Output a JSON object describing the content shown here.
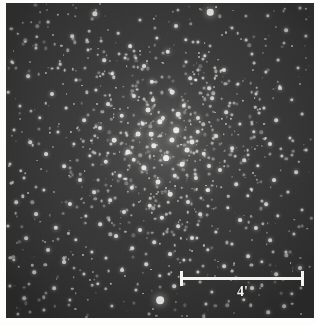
{
  "figure": {
    "kind": "astronomical-photographic-plate",
    "background_color": "#3a3a3a",
    "star_color": "#f2f2ee",
    "paper_color": "#fdfdfb",
    "plate": {
      "left": 6,
      "top": 3,
      "width": 308,
      "height": 315
    }
  },
  "scale_bar": {
    "label": "4'",
    "label_x": 237,
    "label_y": 285,
    "line_x1": 180,
    "line_x2": 304,
    "line_y": 277,
    "line_thickness": 3,
    "cap_height": 15,
    "color": "#f4f4f0"
  },
  "cluster": {
    "center_x": 166,
    "center_y": 142,
    "core_radius": 70
  },
  "chart_data": {
    "type": "scatter",
    "title": "",
    "xlabel": "",
    "ylabel": "",
    "xlim": [
      0,
      308
    ],
    "ylim": [
      0,
      315
    ],
    "grid": false,
    "legend": null,
    "annotations": [
      {
        "text": "4'",
        "x": 237,
        "y": 285
      }
    ],
    "series": [
      {
        "name": "stars",
        "points": [
          [
            95,
            14,
            3.4
          ],
          [
            210,
            12,
            4.2
          ],
          [
            268,
            16,
            2.2
          ],
          [
            300,
            8,
            2.0
          ],
          [
            48,
            22,
            1.8
          ],
          [
            140,
            20,
            2.0
          ],
          [
            176,
            26,
            2.6
          ],
          [
            232,
            28,
            1.9
          ],
          [
            286,
            30,
            2.4
          ],
          [
            18,
            34,
            1.6
          ],
          [
            72,
            36,
            2.3
          ],
          [
            118,
            33,
            1.7
          ],
          [
            157,
            38,
            2.1
          ],
          [
            198,
            42,
            2.0
          ],
          [
            246,
            40,
            1.8
          ],
          [
            306,
            36,
            2.1
          ],
          [
            36,
            48,
            2.0
          ],
          [
            88,
            50,
            1.9
          ],
          [
            130,
            46,
            2.4
          ],
          [
            168,
            52,
            2.9
          ],
          [
            205,
            56,
            2.2
          ],
          [
            252,
            54,
            2.0
          ],
          [
            278,
            60,
            1.8
          ],
          [
            12,
            62,
            2.2
          ],
          [
            60,
            64,
            1.7
          ],
          [
            104,
            60,
            2.3
          ],
          [
            144,
            66,
            2.5
          ],
          [
            186,
            62,
            1.9
          ],
          [
            224,
            70,
            2.6
          ],
          [
            266,
            72,
            2.1
          ],
          [
            298,
            68,
            1.9
          ],
          [
            28,
            76,
            2.4
          ],
          [
            76,
            80,
            1.8
          ],
          [
            112,
            74,
            2.2
          ],
          [
            152,
            82,
            2.8
          ],
          [
            190,
            78,
            2.3
          ],
          [
            238,
            84,
            2.0
          ],
          [
            280,
            88,
            2.5
          ],
          [
            8,
            92,
            1.7
          ],
          [
            52,
            94,
            2.6
          ],
          [
            96,
            90,
            2.0
          ],
          [
            134,
            96,
            2.7
          ],
          [
            172,
            92,
            3.0
          ],
          [
            212,
            98,
            2.4
          ],
          [
            256,
            94,
            1.9
          ],
          [
            292,
            100,
            2.2
          ],
          [
            20,
            106,
            2.0
          ],
          [
            66,
            108,
            1.8
          ],
          [
            108,
            104,
            2.5
          ],
          [
            148,
            110,
            3.2
          ],
          [
            184,
            106,
            2.8
          ],
          [
            226,
            112,
            2.3
          ],
          [
            264,
            108,
            2.0
          ],
          [
            302,
            114,
            1.8
          ],
          [
            40,
            118,
            2.2
          ],
          [
            84,
            120,
            2.4
          ],
          [
            122,
            116,
            2.9
          ],
          [
            160,
            122,
            3.4
          ],
          [
            198,
            118,
            2.6
          ],
          [
            240,
            124,
            2.1
          ],
          [
            276,
            120,
            2.3
          ],
          [
            14,
            130,
            1.9
          ],
          [
            58,
            132,
            2.0
          ],
          [
            100,
            128,
            2.7
          ],
          [
            138,
            134,
            3.1
          ],
          [
            176,
            130,
            3.6
          ],
          [
            216,
            136,
            2.5
          ],
          [
            254,
            132,
            2.2
          ],
          [
            290,
            138,
            2.0
          ],
          [
            30,
            142,
            2.3
          ],
          [
            74,
            144,
            2.1
          ],
          [
            114,
            140,
            3.0
          ],
          [
            154,
            146,
            3.5
          ],
          [
            192,
            142,
            3.2
          ],
          [
            232,
            148,
            2.4
          ],
          [
            270,
            144,
            2.6
          ],
          [
            306,
            150,
            1.8
          ],
          [
            46,
            154,
            2.5
          ],
          [
            90,
            156,
            2.2
          ],
          [
            128,
            152,
            3.3
          ],
          [
            166,
            158,
            3.8
          ],
          [
            204,
            154,
            2.9
          ],
          [
            244,
            160,
            2.3
          ],
          [
            282,
            156,
            2.1
          ],
          [
            10,
            164,
            2.0
          ],
          [
            64,
            166,
            2.4
          ],
          [
            106,
            162,
            2.8
          ],
          [
            144,
            168,
            3.4
          ],
          [
            182,
            164,
            3.0
          ],
          [
            220,
            170,
            2.6
          ],
          [
            258,
            166,
            2.2
          ],
          [
            296,
            172,
            2.4
          ],
          [
            24,
            178,
            1.9
          ],
          [
            80,
            180,
            2.6
          ],
          [
            120,
            176,
            2.9
          ],
          [
            158,
            182,
            3.2
          ],
          [
            196,
            178,
            2.7
          ],
          [
            236,
            184,
            2.3
          ],
          [
            274,
            180,
            2.5
          ],
          [
            44,
            190,
            2.1
          ],
          [
            94,
            192,
            2.4
          ],
          [
            132,
            188,
            2.8
          ],
          [
            170,
            194,
            3.0
          ],
          [
            208,
            190,
            2.5
          ],
          [
            248,
            196,
            2.2
          ],
          [
            288,
            192,
            2.0
          ],
          [
            16,
            202,
            2.3
          ],
          [
            70,
            204,
            2.7
          ],
          [
            110,
            200,
            2.4
          ],
          [
            150,
            206,
            2.9
          ],
          [
            188,
            202,
            2.6
          ],
          [
            228,
            208,
            2.2
          ],
          [
            266,
            204,
            2.4
          ],
          [
            302,
            210,
            1.9
          ],
          [
            36,
            214,
            2.5
          ],
          [
            86,
            216,
            2.1
          ],
          [
            124,
            212,
            2.6
          ],
          [
            162,
            218,
            2.8
          ],
          [
            200,
            214,
            2.3
          ],
          [
            240,
            220,
            2.5
          ],
          [
            278,
            216,
            2.2
          ],
          [
            8,
            226,
            2.0
          ],
          [
            56,
            228,
            2.8
          ],
          [
            100,
            224,
            2.3
          ],
          [
            140,
            230,
            2.6
          ],
          [
            178,
            226,
            2.4
          ],
          [
            216,
            232,
            2.1
          ],
          [
            256,
            228,
            2.7
          ],
          [
            294,
            234,
            2.0
          ],
          [
            26,
            238,
            2.4
          ],
          [
            76,
            240,
            2.2
          ],
          [
            116,
            236,
            2.5
          ],
          [
            154,
            242,
            2.3
          ],
          [
            192,
            238,
            2.6
          ],
          [
            232,
            244,
            2.0
          ],
          [
            270,
            240,
            2.4
          ],
          [
            48,
            250,
            2.6
          ],
          [
            92,
            252,
            2.1
          ],
          [
            132,
            248,
            2.3
          ],
          [
            170,
            254,
            2.5
          ],
          [
            208,
            250,
            2.2
          ],
          [
            248,
            256,
            2.4
          ],
          [
            286,
            252,
            2.0
          ],
          [
            14,
            260,
            2.2
          ],
          [
            64,
            262,
            2.5
          ],
          [
            106,
            258,
            2.0
          ],
          [
            146,
            264,
            2.3
          ],
          [
            184,
            260,
            2.1
          ],
          [
            224,
            266,
            2.4
          ],
          [
            262,
            262,
            2.2
          ],
          [
            300,
            268,
            2.6
          ],
          [
            34,
            272,
            2.3
          ],
          [
            84,
            274,
            2.0
          ],
          [
            122,
            270,
            2.5
          ],
          [
            160,
            276,
            2.2
          ],
          [
            198,
            272,
            2.1
          ],
          [
            236,
            278,
            1.9
          ],
          [
            276,
            274,
            2.3
          ],
          [
            10,
            286,
            2.1
          ],
          [
            54,
            288,
            2.4
          ],
          [
            98,
            284,
            2.2
          ],
          [
            136,
            290,
            2.0
          ],
          [
            174,
            286,
            2.3
          ],
          [
            212,
            292,
            2.1
          ],
          [
            252,
            288,
            2.5
          ],
          [
            292,
            294,
            2.2
          ],
          [
            24,
            298,
            2.3
          ],
          [
            70,
            300,
            2.1
          ],
          [
            160,
            300,
            5.0
          ],
          [
            206,
            304,
            2.0
          ],
          [
            244,
            300,
            2.2
          ],
          [
            284,
            306,
            2.4
          ],
          [
            112,
            306,
            2.1
          ],
          [
            44,
            310,
            2.0
          ],
          [
            268,
            312,
            2.3
          ],
          [
            186,
            40,
            2.2
          ],
          [
            125,
            58,
            1.9
          ],
          [
            209,
            88,
            2.4
          ],
          [
            153,
            100,
            2.6
          ],
          [
            178,
            114,
            3.0
          ],
          [
            143,
            124,
            2.8
          ],
          [
            198,
            132,
            2.9
          ],
          [
            163,
            118,
            2.7
          ],
          [
            187,
            150,
            3.1
          ],
          [
            134,
            160,
            2.9
          ],
          [
            209,
            166,
            2.6
          ],
          [
            175,
            176,
            2.8
          ],
          [
            151,
            134,
            3.0
          ],
          [
            172,
            140,
            3.3
          ]
        ]
      }
    ]
  }
}
